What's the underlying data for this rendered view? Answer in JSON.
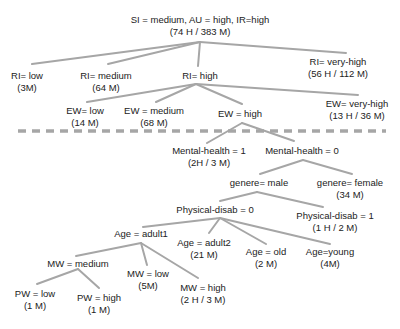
{
  "diagram": {
    "type": "decision-tree",
    "nodes": [
      {
        "id": "root",
        "label": "SI = medium, AU = high, IR=high",
        "count": "(74 H / 383 M)",
        "x": 200,
        "y": 14
      },
      {
        "id": "ri-low",
        "label": "RI= low",
        "count": "(3M)",
        "x": 27,
        "y": 70
      },
      {
        "id": "ri-medium",
        "label": "RI= medium",
        "count": "(64 M)",
        "x": 106,
        "y": 70
      },
      {
        "id": "ri-high",
        "label": "RI= high",
        "count": "",
        "x": 200,
        "y": 70
      },
      {
        "id": "ri-very-high",
        "label": "RI= very-high",
        "count": "(56 H / 112 M)",
        "x": 338,
        "y": 70
      },
      {
        "id": "ew-low",
        "label": "EW= low",
        "count": "(14 M)",
        "x": 85,
        "y": 108
      },
      {
        "id": "ew-medium",
        "label": "EW = medium",
        "count": "(68 M)",
        "x": 154,
        "y": 108
      },
      {
        "id": "ew-high",
        "label": "EW = high",
        "count": "",
        "x": 240,
        "y": 112
      },
      {
        "id": "ew-very-high",
        "label": "EW= very-high",
        "count": "(13 H / 36 M)",
        "x": 358,
        "y": 102
      },
      {
        "id": "mh-1",
        "label": "Mental-health = 1",
        "count": "(2H / 3 M)",
        "x": 210,
        "y": 147
      },
      {
        "id": "mh-0",
        "label": "Mental-health = 0",
        "count": "",
        "x": 302,
        "y": 147
      },
      {
        "id": "gen-male",
        "label": "genere= male",
        "count": "",
        "x": 259,
        "y": 180
      },
      {
        "id": "gen-female",
        "label": "genere= female",
        "count": "(34 M)",
        "x": 349,
        "y": 180
      },
      {
        "id": "pd-0",
        "label": "Physical-disab = 0",
        "count": "",
        "x": 215,
        "y": 206
      },
      {
        "id": "pd-1",
        "label": "Physical-disab = 1",
        "count": "(1 H / 2 M)",
        "x": 335,
        "y": 218
      },
      {
        "id": "age-adult1",
        "label": "Age = adult1",
        "count": "",
        "x": 145,
        "y": 230
      },
      {
        "id": "age-adult2",
        "label": "Age = adult2",
        "count": "(21 M)",
        "x": 204,
        "y": 244
      },
      {
        "id": "age-old",
        "label": "Age = old",
        "count": "(2 M)",
        "x": 266,
        "y": 249
      },
      {
        "id": "age-young",
        "label": "Age=young",
        "count": "(4M)",
        "x": 330,
        "y": 249
      },
      {
        "id": "mw-medium",
        "label": "MW = medium",
        "count": "",
        "x": 75,
        "y": 259
      },
      {
        "id": "mw-low",
        "label": "MW = low",
        "count": "(5M)",
        "x": 150,
        "y": 270
      },
      {
        "id": "mw-high",
        "label": "MW = high",
        "count": "(2 H / 3 M)",
        "x": 203,
        "y": 283
      },
      {
        "id": "pw-low",
        "label": "PW = low",
        "count": "(1 M)",
        "x": 35,
        "y": 289
      },
      {
        "id": "pw-high",
        "label": "PW = high",
        "count": "(1 M)",
        "x": 99,
        "y": 293
      }
    ],
    "edges": [
      [
        "root",
        "ri-low"
      ],
      [
        "root",
        "ri-medium"
      ],
      [
        "root",
        "ri-high"
      ],
      [
        "root",
        "ri-very-high"
      ],
      [
        "ri-high",
        "ew-low"
      ],
      [
        "ri-high",
        "ew-medium"
      ],
      [
        "ri-high",
        "ew-high"
      ],
      [
        "ri-high",
        "ew-very-high"
      ],
      [
        "ew-high",
        "mh-1"
      ],
      [
        "ew-high",
        "mh-0"
      ],
      [
        "mh-0",
        "gen-male"
      ],
      [
        "mh-0",
        "gen-female"
      ],
      [
        "gen-male",
        "pd-0"
      ],
      [
        "gen-male",
        "pd-1"
      ],
      [
        "pd-0",
        "age-adult1"
      ],
      [
        "pd-0",
        "age-adult2"
      ],
      [
        "pd-0",
        "age-old"
      ],
      [
        "pd-0",
        "age-young"
      ],
      [
        "age-adult1",
        "mw-medium"
      ],
      [
        "age-adult1",
        "mw-low"
      ],
      [
        "age-adult1",
        "mw-high"
      ],
      [
        "mw-medium",
        "pw-low"
      ],
      [
        "mw-medium",
        "pw-high"
      ]
    ],
    "separator": {
      "style": "dashed",
      "color": "#a6a6a6"
    },
    "colors": {
      "edge": "#a6a6a6",
      "text": "#222222"
    }
  }
}
